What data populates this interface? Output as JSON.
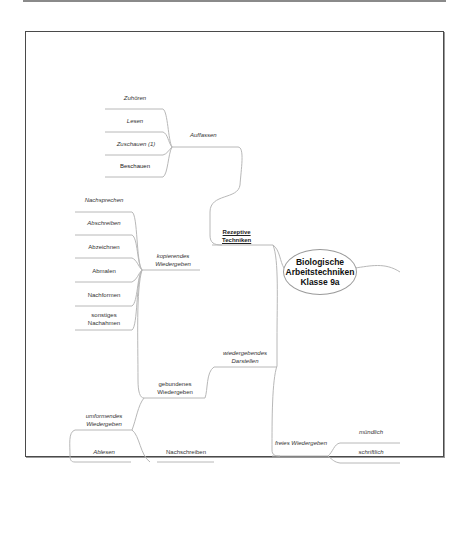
{
  "diagram": {
    "type": "mindmap",
    "center": {
      "title": "Biologische\nArbeitstechniken\nKlasse 9a"
    },
    "branches": {
      "rezeptive": {
        "label": "Rezeptive\nTechniken",
        "auffassen": {
          "label": "Auffassen",
          "children": [
            "Zuhören",
            "Lesen",
            "Zuschauen (1)",
            "Beschauen"
          ]
        }
      },
      "wiedergebendes": {
        "label": "wiedergebendes\nDarstellen",
        "kopierendes": {
          "label": "kopierendes\nWiedergeben",
          "children": [
            "Nachsprechen",
            "Abschreiben",
            "Abzeichnen",
            "Abmalen",
            "Nachformen",
            "sonstiges\nNachahmen"
          ]
        },
        "gebundenes": {
          "label": "gebundenes\nWiedergeben",
          "umformendes": {
            "label": "umformendes\nWiedergeben",
            "children": [
              "Ablesen"
            ]
          },
          "children": [
            "Nachschreiben"
          ]
        },
        "freies": {
          "label": "freies Wiedergeben",
          "children": [
            "mündlich",
            "schriftlich"
          ]
        }
      }
    }
  }
}
